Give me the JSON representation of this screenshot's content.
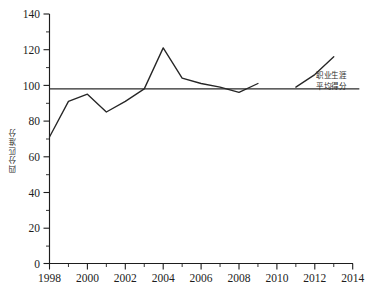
{
  "chart_data": {
    "type": "line",
    "title": "",
    "xlabel": "",
    "ylabel": "四分匹准分",
    "xlim": [
      1998,
      2014
    ],
    "ylim": [
      0,
      140
    ],
    "grid": false,
    "legend_position": "right-inline-annotation",
    "x_tick_labels": [
      "1998",
      "2000",
      "2002",
      "2004",
      "2006",
      "2008",
      "2010",
      "2012",
      "2014"
    ],
    "x_tick_values": [
      1998,
      2000,
      2002,
      2004,
      2006,
      2008,
      2010,
      2012,
      2014
    ],
    "x_minor_tick_values": [
      1999,
      2001,
      2003,
      2005,
      2007,
      2009,
      2011,
      2013
    ],
    "y_tick_labels": [
      "0",
      "20",
      "40",
      "60",
      "80",
      "100",
      "120",
      "140"
    ],
    "y_tick_values": [
      0,
      20,
      40,
      60,
      80,
      100,
      120,
      140
    ],
    "y_minor_tick_values": [
      10,
      30,
      50,
      70,
      90,
      110,
      130
    ],
    "series": [
      {
        "name": "年度得分",
        "color": "#262626",
        "x": [
          1998,
          1999,
          2000,
          2001,
          2002,
          2003,
          2004,
          2005,
          2006,
          2007,
          2008,
          2009
        ],
        "values": [
          71,
          91,
          95,
          85,
          91,
          98,
          121,
          104,
          101,
          99,
          96,
          101
        ]
      },
      {
        "name": "年度得分（续）",
        "color": "#262626",
        "x": [
          2011,
          2012,
          2013
        ],
        "values": [
          99,
          106,
          116
        ]
      }
    ],
    "reference_line": {
      "label_line1": "职业生涯",
      "label_line2": "平均得分",
      "value": 98,
      "color": "#2a2a2a",
      "x_start": 1998,
      "x_end": 2014.35
    }
  },
  "annotation": {
    "line1": "职业生涯",
    "line2": "平均得分"
  },
  "axis": {
    "y_label_text": "四分匹准分"
  }
}
